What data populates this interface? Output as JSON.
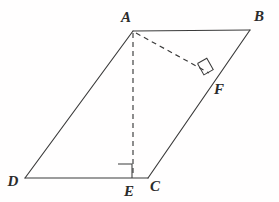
{
  "figure": {
    "width": 279,
    "height": 202,
    "background_color": "#fffefe",
    "line_color": "#3a3a3a",
    "label_color": "#2b2b2b"
  },
  "vertices": [
    {
      "id": "A",
      "label": "A",
      "x": 133,
      "y": 31,
      "label_x": 126,
      "label_y": 22
    },
    {
      "id": "B",
      "label": "B",
      "x": 250,
      "y": 30,
      "label_x": 259,
      "label_y": 21
    },
    {
      "id": "C",
      "label": "C",
      "x": 148,
      "y": 178,
      "label_x": 155,
      "label_y": 191
    },
    {
      "id": "D",
      "label": "D",
      "x": 25,
      "y": 178,
      "label_x": 13,
      "label_y": 186
    },
    {
      "id": "E",
      "label": "E",
      "x": 133,
      "y": 178,
      "label_x": 129,
      "label_y": 196
    },
    {
      "id": "F",
      "label": "F",
      "x": 209,
      "y": 73,
      "label_x": 219,
      "label_y": 94
    }
  ],
  "segments": [
    {
      "id": "AB",
      "from": "A",
      "to": "B",
      "style": "solid",
      "name": "side-ab"
    },
    {
      "id": "BC",
      "from": "B",
      "to": "C",
      "style": "solid",
      "name": "side-bc"
    },
    {
      "id": "CD",
      "from": "C",
      "to": "D",
      "style": "solid",
      "name": "side-cd"
    },
    {
      "id": "DA",
      "from": "D",
      "to": "A",
      "style": "solid",
      "name": "side-da"
    },
    {
      "id": "DE",
      "from": "D",
      "to": "E",
      "style": "solid",
      "name": "base-de"
    },
    {
      "id": "AE",
      "from": "A",
      "to": "E",
      "style": "dashed",
      "name": "altitude-ae"
    },
    {
      "id": "AF",
      "from": "A",
      "to": "F",
      "style": "dashed",
      "name": "altitude-af"
    }
  ],
  "right_angles": [
    {
      "id": "angle-AEC",
      "at": "E",
      "label": "right angle at E between AE and DC"
    },
    {
      "id": "angle-AFB",
      "at": "F",
      "label": "right angle at F between AF and BC"
    }
  ]
}
